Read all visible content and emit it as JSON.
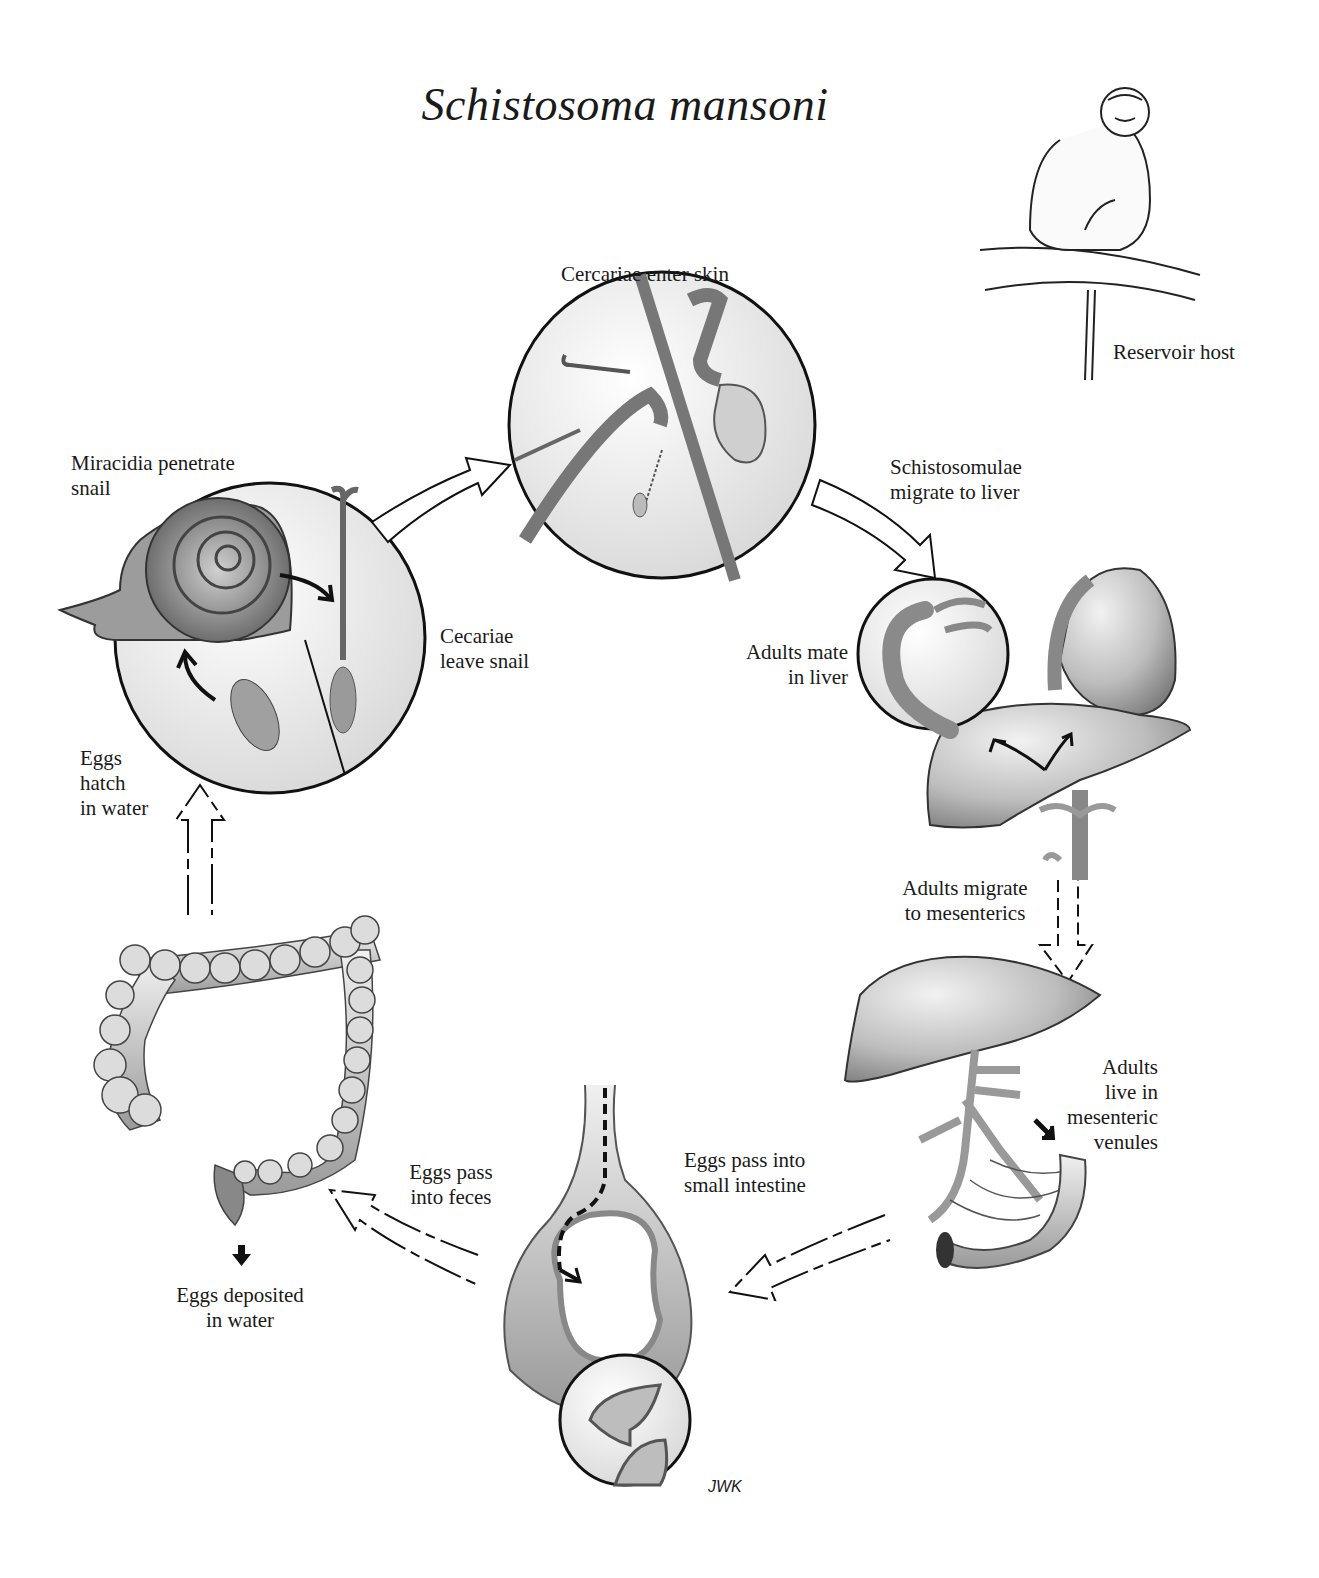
{
  "title": "Schistosoma mansoni",
  "labels": {
    "cercariae_enter_skin": "Cercariae enter skin",
    "reservoir_host": "Reservoir host",
    "miracidia_penetrate_snail": "Miracidia penetrate\nsnail",
    "schistosomulae_migrate": "Schistosomulae\nmigrate to liver",
    "cecariae_leave_snail": "Cecariae\nleave snail",
    "adults_mate_in_liver": "Adults mate\nin liver",
    "eggs_hatch_in_water": "Eggs\nhatch\nin water",
    "adults_migrate_to_mesenterics": "Adults migrate\nto mesenterics",
    "adults_live_in_mesenteric_venules": "Adults\nlive in\nmesenteric\nvenules",
    "eggs_pass_into_small_intestine": "Eggs pass into\nsmall intestine",
    "eggs_pass_into_feces": "Eggs pass\ninto feces",
    "eggs_deposited_in_water": "Eggs deposited\nin water"
  },
  "signature": "JWK",
  "stages": [
    {
      "id": "snail",
      "illustration": "snail-inset-circle"
    },
    {
      "id": "skin",
      "illustration": "skin-penetration-circle"
    },
    {
      "id": "liver",
      "illustration": "liver-heart-with-worm-pair-inset"
    },
    {
      "id": "mesenterics",
      "illustration": "liver-mesenteric-venules-intestine"
    },
    {
      "id": "small-intestine",
      "illustration": "intestinal-cross-section-with-inset"
    },
    {
      "id": "colon",
      "illustration": "large-intestine"
    },
    {
      "id": "reservoir",
      "illustration": "monkey-on-branch"
    }
  ],
  "colors": {
    "background": "#ffffff",
    "ink": "#1a1a1a",
    "tissue_light": "#e4e4e4",
    "tissue_mid": "#b8b8b8",
    "tissue_dark": "#7a7a7a"
  }
}
